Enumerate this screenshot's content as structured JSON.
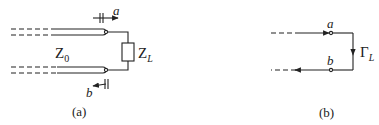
{
  "diagram": {
    "panel_a": {
      "caption": "(a)",
      "line_impedance_label": "Z",
      "line_impedance_sub": "0",
      "load_label": "Z",
      "load_sub": "L",
      "incident_wave_label": "a",
      "reflected_wave_label": "b"
    },
    "panel_b": {
      "caption": "(b)",
      "node_a_label": "a",
      "node_b_label": "b",
      "reflection_label": "Γ",
      "reflection_sub": "L"
    },
    "colors": {
      "stroke": "#222222",
      "background": "#ffffff"
    }
  }
}
